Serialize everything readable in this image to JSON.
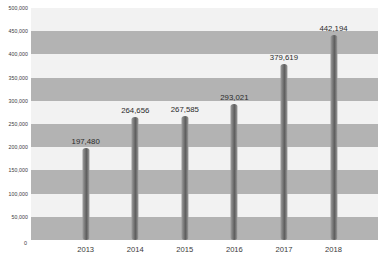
{
  "chart_data": {
    "type": "bar",
    "title": "",
    "subtitle": "",
    "xlabel": "",
    "ylabel": "",
    "categories": [
      "2013",
      "2014",
      "2015",
      "2016",
      "2017",
      "2018"
    ],
    "values": [
      197480,
      264656,
      267585,
      293021,
      379619,
      442194
    ],
    "value_labels": [
      "197,480",
      "264,656",
      "267,585",
      "293,021",
      "379,619",
      "442,194"
    ],
    "ylim": [
      0,
      500000
    ],
    "y_ticks": [
      0,
      50000,
      100000,
      150000,
      200000,
      250000,
      300000,
      350000,
      400000,
      450000,
      500000
    ],
    "y_tick_labels": [
      "0",
      "50,000",
      "100,000",
      "150,000",
      "200,000",
      "250,000",
      "300,000",
      "350,000",
      "400,000",
      "450,000",
      "500,000"
    ],
    "grid": "alternating-horizontal-bands",
    "legend": "none",
    "series": [
      {
        "name": "",
        "values": [
          197480,
          264656,
          267585,
          293021,
          379619,
          442194
        ]
      }
    ]
  },
  "style": {
    "plot_background_light": "#f2f2f2",
    "plot_background_dark": "#b3b3b3",
    "bar_color": "#6e6e6e",
    "bar_highlight": "#a4a4a4",
    "text_color": "#3a3a3a",
    "page_background": "#ffffff"
  }
}
